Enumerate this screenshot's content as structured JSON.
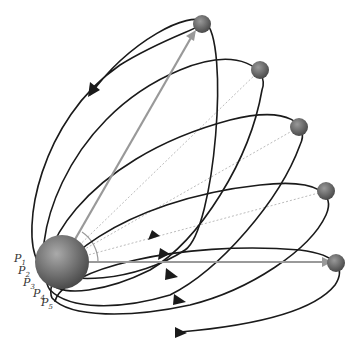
{
  "diagram": {
    "type": "orbital-trajectories",
    "central_body": {
      "name": "earth",
      "cx": 62,
      "cy": 262,
      "r": 27
    },
    "points": [
      {
        "label": "P",
        "sub": "1",
        "x": 14,
        "y": 262
      },
      {
        "label": "P",
        "sub": "2",
        "x": 18,
        "y": 274
      },
      {
        "label": "P",
        "sub": "3",
        "x": 24,
        "y": 285
      },
      {
        "label": "P",
        "sub": "4",
        "x": 32,
        "y": 294
      },
      {
        "label": "P",
        "sub": "5",
        "x": 40,
        "y": 303
      }
    ],
    "targets": [
      {
        "cx": 202,
        "cy": 24
      },
      {
        "cx": 260,
        "cy": 70
      },
      {
        "cx": 299,
        "cy": 127
      },
      {
        "cx": 326,
        "cy": 191
      },
      {
        "cx": 336,
        "cy": 263
      }
    ],
    "colors": {
      "orbit": "#1a1a1a",
      "vector": "#999999",
      "dashed": "#aaaaaa",
      "planet": "#666666"
    }
  }
}
